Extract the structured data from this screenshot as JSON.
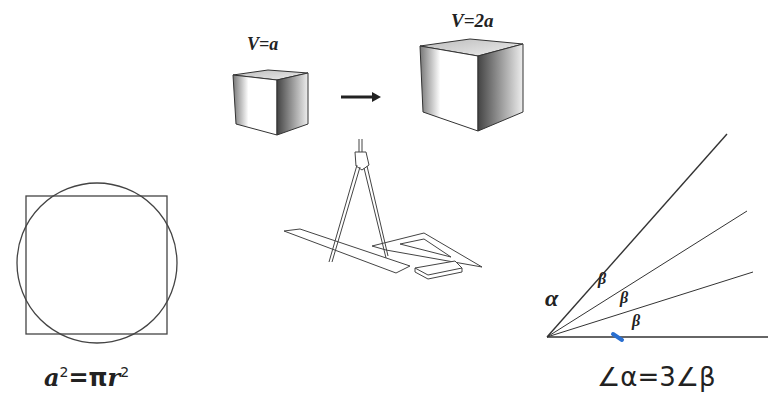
{
  "diagram": {
    "cube_small": {
      "label": "V=a"
    },
    "cube_large": {
      "label": "V=2a"
    },
    "arrow": {
      "direction": "right"
    },
    "circle_square": {
      "formula": "a²=πr²",
      "formula_base_a": "a",
      "formula_eq": "=π",
      "formula_r": "r",
      "sup": "2"
    },
    "angle_trisection": {
      "alpha_label": "α",
      "beta_labels": [
        "β",
        "β",
        "β"
      ],
      "formula": "∠α=3∠β",
      "mark_color": "#2a6fd0"
    },
    "tools": {
      "items": [
        "compass",
        "ruler",
        "set-square",
        "eraser"
      ]
    }
  }
}
